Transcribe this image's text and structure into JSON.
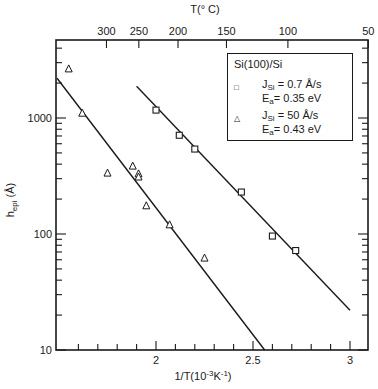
{
  "chart_data": {
    "type": "scatter",
    "title": "",
    "xlabel": "1/T(10^-3 K^-1)",
    "xlabel_parts": {
      "main": "1/T(10",
      "exp1": "-3",
      "unit": "K",
      "exp2": "-1",
      "close": ")"
    },
    "ylabel": "h_epi (Å)",
    "ylabel_parts": {
      "main": "h",
      "sub": "epi",
      "unit": " (Å)"
    },
    "top_xlabel": "T(° C)",
    "xlim": [
      1.5,
      3.1
    ],
    "ylim": [
      10,
      5000
    ],
    "yscale": "log",
    "x_ticks": [
      {
        "value": 2,
        "label": "2"
      },
      {
        "value": 2.5,
        "label": "2.5"
      },
      {
        "value": 3,
        "label": "3"
      }
    ],
    "x_minor_step": 0.1,
    "y_ticks": [
      {
        "value": 10,
        "label": "10"
      },
      {
        "value": 100,
        "label": "100"
      },
      {
        "value": 1000,
        "label": "1000"
      }
    ],
    "top_ticks": [
      {
        "label": "300",
        "celsius": 300
      },
      {
        "label": "250",
        "celsius": 250
      },
      {
        "label": "200",
        "celsius": 200
      },
      {
        "label": "150",
        "celsius": 150
      },
      {
        "label": "100",
        "celsius": 100
      },
      {
        "label": "50",
        "celsius": 50
      }
    ],
    "grid": false,
    "legend_position": "upper right",
    "legend": {
      "title": "Si(100)/Si",
      "entries": [
        {
          "marker": "square",
          "symbol": "□",
          "line1": {
            "prefix": "J",
            "sub": "Si",
            "value": " = 0.7 Å/s"
          },
          "line2": {
            "prefix": "E",
            "sub": "a",
            "value": "= 0.35  eV"
          }
        },
        {
          "marker": "triangle",
          "symbol": "△",
          "line1": {
            "prefix": "J",
            "sub": "Si",
            "value": " = 50 Å/s"
          },
          "line2": {
            "prefix": "E",
            "sub": "a",
            "value": "= 0.43  eV"
          }
        }
      ]
    },
    "series": [
      {
        "name": "J_Si = 0.7 Å/s, E_a = 0.35 eV",
        "marker": "square",
        "x": [
          2.0,
          2.12,
          2.2,
          2.44,
          2.6,
          2.72
        ],
        "y": [
          1170,
          710,
          540,
          230,
          96,
          72
        ],
        "fit_line": {
          "x": [
            1.9,
            3.0
          ],
          "y": [
            1880,
            22
          ]
        }
      },
      {
        "name": "J_Si = 50 Å/s, E_a = 0.43 eV",
        "marker": "triangle",
        "x": [
          1.55,
          1.62,
          1.75,
          1.88,
          1.91,
          1.91,
          1.95,
          2.07,
          2.25
        ],
        "y": [
          2650,
          1100,
          335,
          385,
          330,
          310,
          175,
          120,
          62
        ],
        "fit_line": {
          "x": [
            1.49,
            2.56
          ],
          "y": [
            2200,
            10
          ]
        }
      }
    ]
  }
}
